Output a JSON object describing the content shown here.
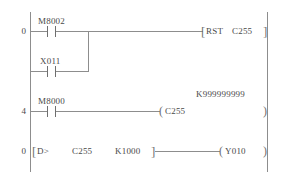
{
  "diagram": {
    "type": "ladder-logic",
    "title_caption": "",
    "line_color": "#8d8d8d",
    "text_color": "#4a4a4a",
    "background": "#ffffff",
    "left_rail_label": "",
    "rungs": [
      {
        "step": "0",
        "contacts": [
          {
            "label": "M8002",
            "kind": "normally-open"
          },
          {
            "label": "X011",
            "kind": "normally-open"
          }
        ],
        "instruction": {
          "open_bracket": "[",
          "mnemonic": "RST",
          "operand": "C255",
          "close_bracket": "]"
        }
      },
      {
        "step": "4",
        "contacts": [
          {
            "label": "M8000",
            "kind": "normally-open"
          }
        ],
        "coil": {
          "open": "(",
          "label": "C255",
          "close": ")",
          "preset": "K999999999"
        }
      },
      {
        "step": "0",
        "compare": {
          "open_bracket": "[",
          "mnemonic": "D>",
          "operand1": "C255",
          "operand2": "K1000",
          "close_bracket": "]"
        },
        "coil": {
          "open": "(",
          "label": "Y010",
          "close": ")"
        }
      }
    ]
  }
}
